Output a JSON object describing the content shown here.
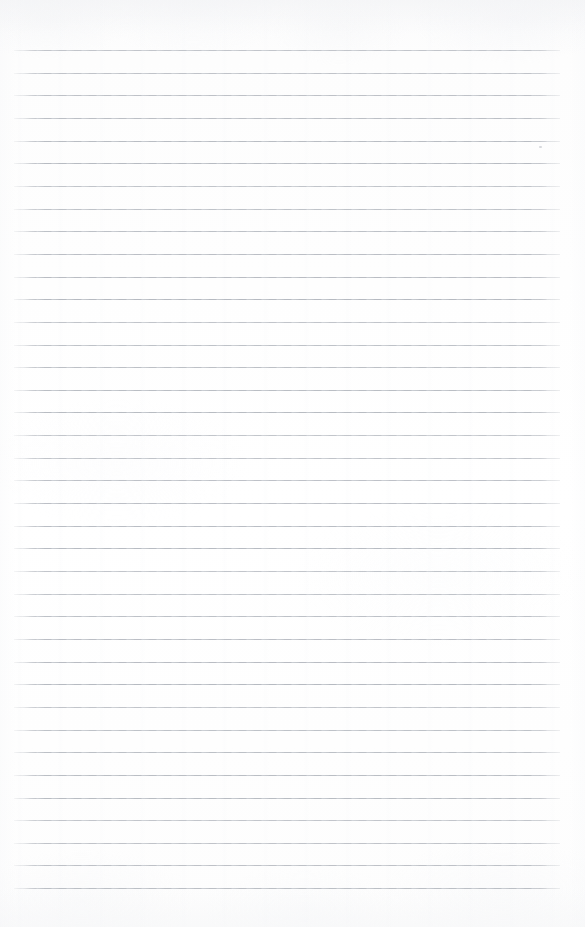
{
  "document": {
    "kind": "scanned-lined-notebook-page",
    "title": "Blank Ruled Paper",
    "content_text": "",
    "page_width": 585,
    "page_height": 927,
    "has_handwriting": false,
    "has_printed_text": false
  },
  "paper": {
    "background_color": "#fdfdfd",
    "highlight_color": "#ffffff",
    "shadow_tint_color": "#f4f5f7",
    "texture": "faint scanner grain with soft vertical banding"
  },
  "ruling": {
    "line_color": "#b9bdc3",
    "line_color_light": "#c6cad0",
    "line_thickness_px": 1,
    "line_spacing_px": 22.65,
    "first_line_y": 50,
    "line_start_x": 14,
    "line_end_x": 560,
    "line_count": 38,
    "lines_y": [
      50.0,
      72.7,
      95.3,
      118.0,
      140.6,
      163.3,
      185.9,
      208.6,
      231.2,
      253.9,
      276.5,
      299.2,
      321.8,
      344.5,
      367.1,
      389.8,
      412.4,
      435.1,
      457.7,
      480.4,
      503.0,
      525.7,
      548.3,
      571.0,
      593.6,
      616.3,
      638.9,
      661.6,
      684.2,
      706.9,
      729.5,
      752.2,
      774.8,
      797.5,
      820.1,
      842.8,
      865.4,
      888.1
    ]
  },
  "margins": {
    "top_blank_px": 50,
    "bottom_blank_px": 39,
    "left_blank_px": 14,
    "right_blank_px": 25
  },
  "artifacts": {
    "speck": {
      "name": "scan-speck",
      "x": 539,
      "y": 146,
      "width": 3,
      "height": 2
    }
  }
}
